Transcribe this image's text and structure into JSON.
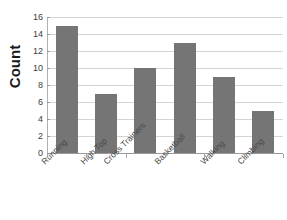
{
  "chart_data": {
    "type": "bar",
    "title": "",
    "xlabel": "",
    "ylabel": "Count",
    "categories": [
      "Running",
      "High Top",
      "Cross Trainers",
      "Basketball",
      "Walking",
      "Climbing"
    ],
    "values": [
      15,
      7,
      10,
      13,
      9,
      5
    ],
    "ylim": [
      0,
      16
    ],
    "ytick_step": 2,
    "yticks": [
      16,
      14,
      12,
      10,
      8,
      6,
      4,
      2,
      0
    ],
    "ytick_labels": [
      "16",
      "14",
      "12",
      "10",
      "8",
      "6",
      "4",
      "2",
      "0"
    ],
    "grid": true,
    "grid_axis": "y",
    "legend": false,
    "legend_position": "none",
    "bar_color": "#757575",
    "gridline_color": "#d4d4d4",
    "axis_color": "#9a9a9a",
    "background_color": "#ffffff",
    "label_rotation": -45
  }
}
